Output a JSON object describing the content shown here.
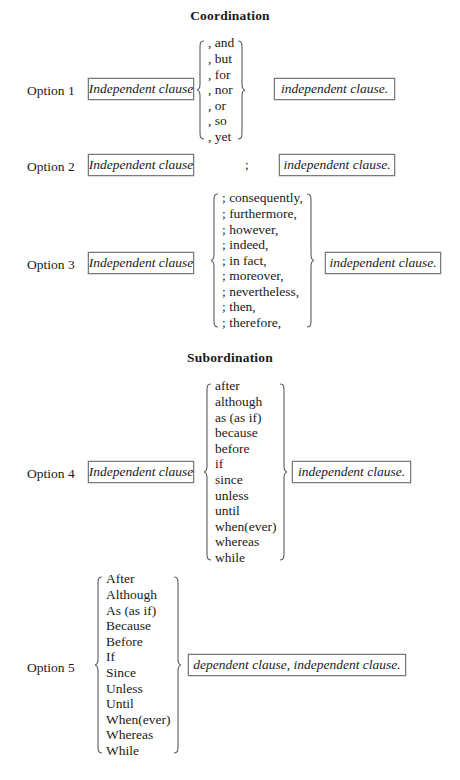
{
  "page": {
    "title": "Sentence Combining Options Chart"
  },
  "sections": [
    {
      "heading": "Coordination",
      "options": [
        {
          "label": "Option 1",
          "left_box": "Independent clause",
          "connector_list": [
            ", and",
            ", but",
            ", for",
            ", nor",
            ", or",
            ", so",
            ", yet"
          ],
          "right_box": "independent clause."
        },
        {
          "label": "Option 2",
          "left_box": "Independent clause",
          "connector_mark": ";",
          "right_box": "independent clause."
        },
        {
          "label": "Option 3",
          "left_box": "Independent clause",
          "connector_list": [
            "; consequently,",
            "; furthermore,",
            "; however,",
            "; indeed,",
            "; in fact,",
            "; moreover,",
            "; nevertheless,",
            "; then,",
            "; therefore,"
          ],
          "right_box": "independent clause."
        }
      ]
    },
    {
      "heading": "Subordination",
      "options": [
        {
          "label": "Option 4",
          "left_box": "Independent clause",
          "connector_list": [
            "after",
            "although",
            "as (as if)",
            "because",
            "before",
            "if",
            "since",
            "unless",
            "until",
            "when(ever)",
            "whereas",
            "while"
          ],
          "right_box": "independent clause."
        },
        {
          "label": "Option 5",
          "connector_list": [
            "After",
            "Although",
            "As (as if)",
            "Because",
            "Before",
            "If",
            "Since",
            "Unless",
            "Until",
            "When(ever)",
            "Whereas",
            "While"
          ],
          "right_box": "dependent clause, independent clause."
        }
      ]
    }
  ],
  "colors": {
    "page_background": "#ffffff",
    "text": "#1a1a1a",
    "box_border": "#7a7a7a",
    "brace_stroke": "#5a5a5a"
  }
}
